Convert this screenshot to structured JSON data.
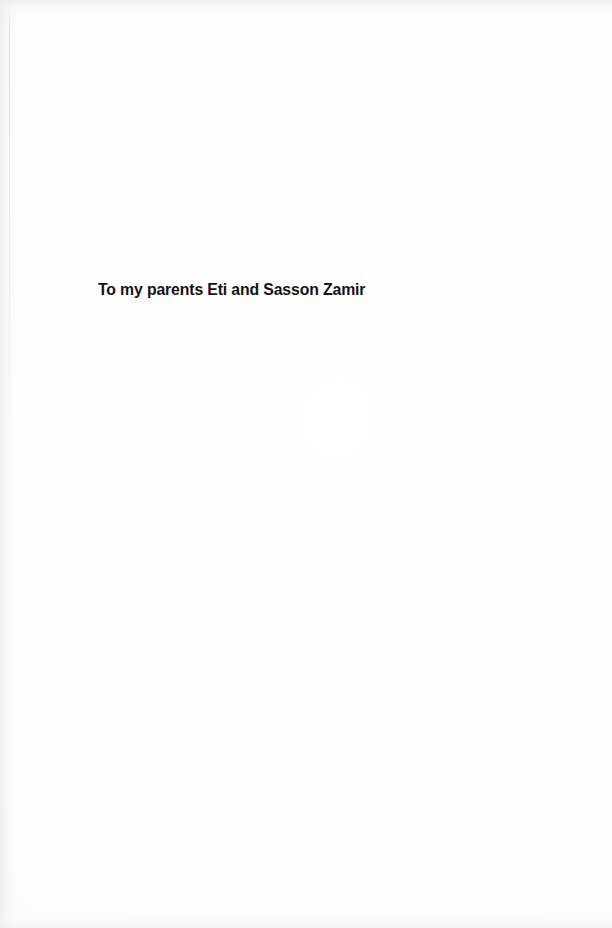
{
  "page": {
    "kind": "book-dedication-page",
    "background_color": "#fdfdfd",
    "text_color": "#141414",
    "width_px": 612,
    "height_px": 928
  },
  "dedication": {
    "line": "To my parents Eti and Sasson Zamir"
  },
  "scan_artifacts": {
    "spine_shadow_side": "left",
    "top_edge_smudge": true,
    "bottom_edge_smudge": true
  }
}
